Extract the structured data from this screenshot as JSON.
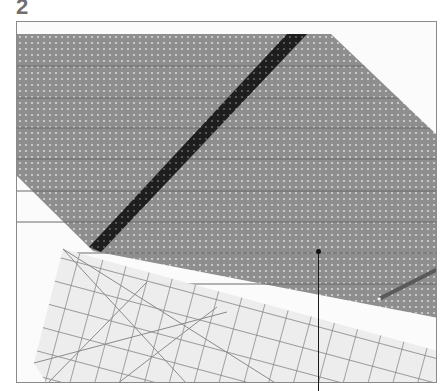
{
  "step": {
    "number": "2"
  },
  "illustration": {
    "subject": "fabric-with-bias-stripe-and-quilting-ruler",
    "colors": {
      "frame_border": "#8a8a8a",
      "background": "#fbfbfb",
      "fabric": "#8e8e8e",
      "fabric_dots": "#d6d6d6",
      "seam_lines": "#6a6a6a",
      "stripe": "#1e1e1e",
      "ruler": "#ececec",
      "ruler_grid": "#7a7a7a",
      "pencil": "#5a5a5a"
    },
    "elements": [
      "fabric",
      "diagonal-stripe",
      "quilting-ruler",
      "pencil",
      "callout-pointer"
    ]
  }
}
